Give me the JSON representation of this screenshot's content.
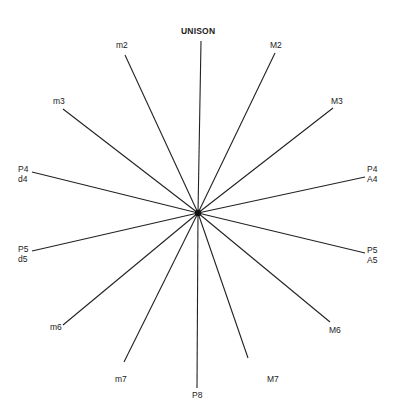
{
  "diagram": {
    "center": {
      "x": 198,
      "y": 213
    },
    "spokes": [
      {
        "id": "unison",
        "lines": [
          "UNISON"
        ],
        "end": {
          "x": 201,
          "y": 41
        },
        "label_pos": {
          "x": 181,
          "y": 26
        }
      },
      {
        "id": "M2",
        "lines": [
          "M2"
        ],
        "end": {
          "x": 275,
          "y": 53
        },
        "label_pos": {
          "x": 270,
          "y": 40
        }
      },
      {
        "id": "M3",
        "lines": [
          "M3"
        ],
        "end": {
          "x": 333,
          "y": 108
        },
        "label_pos": {
          "x": 331,
          "y": 96
        }
      },
      {
        "id": "P4-A4",
        "lines": [
          "P4",
          "A4"
        ],
        "end": {
          "x": 365,
          "y": 177
        },
        "label_pos": {
          "x": 367,
          "y": 164
        }
      },
      {
        "id": "P5-A5",
        "lines": [
          "P5",
          "A5"
        ],
        "end": {
          "x": 365,
          "y": 253
        },
        "label_pos": {
          "x": 367,
          "y": 245
        }
      },
      {
        "id": "M6",
        "lines": [
          "M6"
        ],
        "end": {
          "x": 330,
          "y": 322
        },
        "label_pos": {
          "x": 329,
          "y": 325
        }
      },
      {
        "id": "M7",
        "lines": [
          "M7"
        ],
        "end": {
          "x": 248,
          "y": 358
        },
        "label_pos": {
          "x": 267,
          "y": 374
        }
      },
      {
        "id": "P8",
        "lines": [
          "P8"
        ],
        "end": {
          "x": 197,
          "y": 388
        },
        "label_pos": {
          "x": 192,
          "y": 390
        }
      },
      {
        "id": "m7",
        "lines": [
          "m7"
        ],
        "end": {
          "x": 124,
          "y": 362
        },
        "label_pos": {
          "x": 115,
          "y": 374
        }
      },
      {
        "id": "m6",
        "lines": [
          "m6"
        ],
        "end": {
          "x": 63,
          "y": 325
        },
        "label_pos": {
          "x": 50,
          "y": 322
        }
      },
      {
        "id": "P5-d5",
        "lines": [
          "P5",
          "d5"
        ],
        "end": {
          "x": 32,
          "y": 251
        },
        "label_pos": {
          "x": 18,
          "y": 244
        }
      },
      {
        "id": "P4-d4",
        "lines": [
          "P4",
          "d4"
        ],
        "end": {
          "x": 32,
          "y": 172
        },
        "label_pos": {
          "x": 18,
          "y": 164
        }
      },
      {
        "id": "m3",
        "lines": [
          "m3"
        ],
        "end": {
          "x": 63,
          "y": 109
        },
        "label_pos": {
          "x": 53,
          "y": 96
        }
      },
      {
        "id": "m2",
        "lines": [
          "m2"
        ],
        "end": {
          "x": 125,
          "y": 55
        },
        "label_pos": {
          "x": 116,
          "y": 40
        }
      }
    ],
    "colors": {
      "line": "#222222",
      "text": "#222222",
      "background": "#ffffff"
    }
  }
}
